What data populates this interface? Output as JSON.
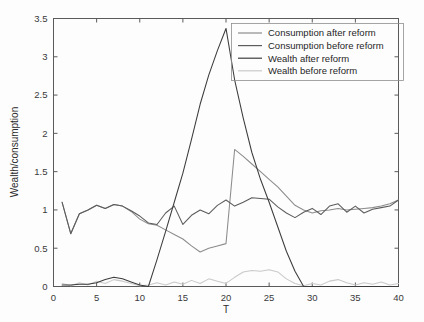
{
  "chart_data": {
    "type": "line",
    "title": "",
    "xlabel": "T",
    "ylabel": "Wealth/consumption",
    "xlim": [
      0,
      40
    ],
    "ylim": [
      0,
      3.5
    ],
    "xticks": [
      0,
      5,
      10,
      15,
      20,
      25,
      30,
      35,
      40
    ],
    "yticks": [
      0,
      0.5,
      1,
      1.5,
      2,
      2.5,
      3,
      3.5
    ],
    "xticklabels": [
      "0",
      "5",
      "10",
      "15",
      "20",
      "25",
      "30",
      "35",
      "40"
    ],
    "yticklabels": [
      "0",
      "0.5",
      "1",
      "1.5",
      "2",
      "2.5",
      "3",
      "3.5"
    ],
    "grid": false,
    "legend_position": "upper right",
    "x": [
      1,
      2,
      3,
      4,
      5,
      6,
      7,
      8,
      9,
      10,
      11,
      12,
      13,
      14,
      15,
      16,
      17,
      18,
      19,
      20,
      21,
      22,
      23,
      24,
      25,
      26,
      27,
      28,
      29,
      30,
      31,
      32,
      33,
      34,
      35,
      36,
      37,
      38,
      39,
      40
    ],
    "series": [
      {
        "name": "Consumption after reform",
        "color": "#8c8c8c",
        "values": [
          1.1,
          0.69,
          0.95,
          1.0,
          1.06,
          1.02,
          1.07,
          1.05,
          0.98,
          0.88,
          0.82,
          0.8,
          0.74,
          0.68,
          0.62,
          0.53,
          0.45,
          0.5,
          0.53,
          0.56,
          1.79,
          1.7,
          1.6,
          1.5,
          1.4,
          1.3,
          1.18,
          1.06,
          1.0,
          0.96,
          0.99,
          1.0,
          1.02,
          1.0,
          1.01,
          1.02,
          1.03,
          1.05,
          1.08,
          1.13
        ]
      },
      {
        "name": "Consumption before reform",
        "color": "#5c5c5c",
        "values": [
          1.1,
          0.69,
          0.95,
          1.0,
          1.06,
          1.02,
          1.07,
          1.05,
          0.99,
          0.92,
          0.83,
          0.81,
          0.96,
          1.05,
          0.81,
          0.93,
          1.0,
          0.95,
          1.06,
          1.13,
          1.05,
          1.1,
          1.16,
          1.15,
          1.14,
          1.04,
          0.96,
          0.9,
          0.97,
          1.02,
          0.94,
          1.05,
          1.08,
          0.97,
          1.05,
          0.96,
          1.01,
          1.03,
          1.05,
          1.13
        ]
      },
      {
        "name": "Wealth after reform",
        "color": "#3c3c3c",
        "values": [
          0.02,
          0.02,
          0.03,
          0.03,
          0.05,
          0.09,
          0.12,
          0.1,
          0.06,
          0.02,
          0.0,
          0.35,
          0.72,
          1.1,
          1.48,
          1.92,
          2.38,
          2.76,
          3.08,
          3.37,
          2.7,
          2.2,
          1.75,
          1.4,
          1.1,
          0.78,
          0.46,
          0.2,
          0.0,
          0.0,
          0.0,
          0.0,
          0.0,
          0.0,
          0.0,
          0.0,
          0.0,
          0.0,
          0.0,
          0.0
        ]
      },
      {
        "name": "Wealth before reform",
        "color": "#c9c9c9",
        "values": [
          0.04,
          0.01,
          0.05,
          0.02,
          0.07,
          0.04,
          0.09,
          0.07,
          0.04,
          0.01,
          0.02,
          0.05,
          0.02,
          0.06,
          0.03,
          0.08,
          0.04,
          0.1,
          0.07,
          0.04,
          0.12,
          0.19,
          0.21,
          0.2,
          0.22,
          0.19,
          0.1,
          0.04,
          0.01,
          0.04,
          0.02,
          0.07,
          0.09,
          0.05,
          0.02,
          0.05,
          0.03,
          0.06,
          0.02,
          0.04
        ]
      }
    ],
    "annotations": {
      "peak_wealth_after_reform": 3.37,
      "peak_wealth_after_reform_t": 20,
      "consumption_after_reform_jump": 1.79,
      "consumption_after_reform_jump_t": 21
    }
  },
  "legend": {
    "items": [
      {
        "label": "Consumption after reform"
      },
      {
        "label": "Consumption before reform"
      },
      {
        "label": "Wealth after reform"
      },
      {
        "label": "Wealth before reform"
      }
    ]
  }
}
